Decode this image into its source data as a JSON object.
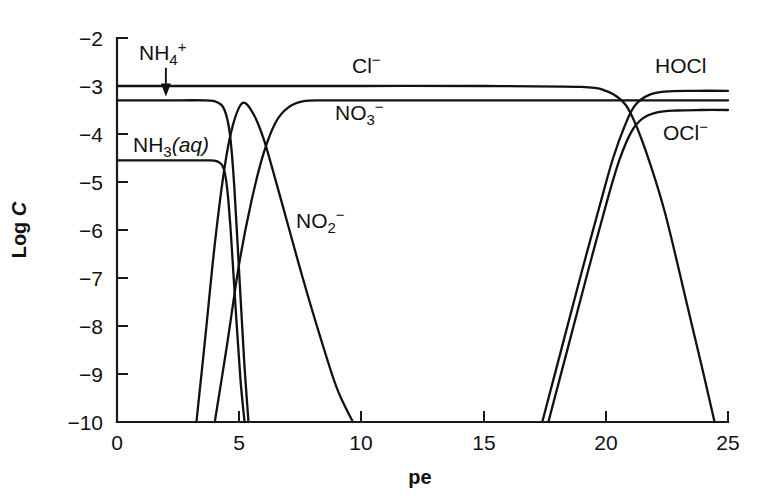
{
  "chart_data": {
    "type": "line",
    "title": "",
    "xlabel": "pe",
    "ylabel": "Log C",
    "xlim": [
      0,
      25
    ],
    "ylim": [
      -10,
      -2
    ],
    "xticks": [
      0,
      5,
      10,
      15,
      20,
      25
    ],
    "yticks": [
      -2,
      -3,
      -4,
      -5,
      -6,
      -7,
      -8,
      -9,
      -10
    ],
    "xtick_labels": [
      "0",
      "5",
      "10",
      "15",
      "20",
      "25"
    ],
    "ytick_labels": [
      "−2",
      "−3",
      "−4",
      "−5",
      "−6",
      "−7",
      "−8",
      "−9",
      "−10"
    ],
    "grid": false,
    "legend": "inline-annotations",
    "line_color": "#111111",
    "axis_color": "#1a1a1a",
    "background": "#ffffff",
    "series": [
      {
        "name": "Cl-",
        "label_text": "Cl",
        "label_sup": "−",
        "label_sub": "",
        "plateau": -3.0,
        "x": [
          0,
          5,
          10,
          15,
          19.0,
          20.0,
          20.6,
          21.0,
          21.6,
          22.4,
          23.3,
          24.0,
          24.45
        ],
        "y": [
          -3.0,
          -3.0,
          -3.0,
          -3.0,
          -3.02,
          -3.1,
          -3.28,
          -3.55,
          -4.3,
          -5.6,
          -7.5,
          -9.0,
          -10.0
        ]
      },
      {
        "name": "NH4+",
        "label_text": "NH",
        "label_sub": "4",
        "label_sup": "+",
        "plateau": -3.3,
        "x": [
          0,
          2,
          3.6,
          4.1,
          4.4,
          4.62,
          4.8,
          5.0,
          5.2,
          5.38
        ],
        "y": [
          -3.3,
          -3.3,
          -3.3,
          -3.34,
          -3.5,
          -4.0,
          -5.1,
          -6.9,
          -8.7,
          -10.0
        ]
      },
      {
        "name": "NH3(aq)",
        "label_text": "NH",
        "label_sub": "3",
        "label_suffix": "(aq)",
        "plateau": -4.55,
        "x": [
          0,
          2,
          3.6,
          4.1,
          4.35,
          4.5,
          4.65,
          4.85,
          5.05,
          5.22
        ],
        "y": [
          -4.55,
          -4.55,
          -4.55,
          -4.57,
          -4.7,
          -5.1,
          -6.0,
          -7.6,
          -9.1,
          -10.0
        ]
      },
      {
        "name": "NO2-",
        "label_text": "NO",
        "label_sub": "2",
        "label_sup": "−",
        "peak": -3.35,
        "peak_pe": 5.15,
        "x": [
          3.25,
          3.6,
          4.0,
          4.4,
          4.75,
          5.15,
          5.6,
          6.0,
          6.4,
          7.0,
          7.6,
          8.3,
          9.0,
          9.65
        ],
        "y": [
          -10.0,
          -8.3,
          -6.3,
          -4.7,
          -3.8,
          -3.35,
          -3.6,
          -4.1,
          -4.8,
          -5.9,
          -7.0,
          -8.2,
          -9.3,
          -10.0
        ]
      },
      {
        "name": "NO3-",
        "label_text": "NO",
        "label_sub": "3",
        "label_sup": "−",
        "plateau": -3.3,
        "x": [
          4.0,
          4.5,
          5.0,
          5.5,
          6.0,
          6.5,
          7.0,
          7.6,
          8.5,
          10,
          13,
          17,
          21,
          25
        ],
        "y": [
          -10.0,
          -8.4,
          -6.7,
          -5.4,
          -4.4,
          -3.75,
          -3.45,
          -3.32,
          -3.3,
          -3.3,
          -3.3,
          -3.3,
          -3.3,
          -3.3
        ]
      },
      {
        "name": "HOCl",
        "label_text": "HOCl",
        "label_sup": "",
        "plateau": -3.1,
        "x": [
          17.4,
          18.2,
          19.0,
          19.8,
          20.3,
          20.8,
          21.2,
          21.8,
          22.6,
          23.6,
          25
        ],
        "y": [
          -10.0,
          -8.45,
          -6.9,
          -5.4,
          -4.5,
          -3.8,
          -3.4,
          -3.18,
          -3.11,
          -3.1,
          -3.1
        ]
      },
      {
        "name": "OCl-",
        "label_text": "OCl",
        "label_sup": "−",
        "plateau": -3.5,
        "x": [
          17.65,
          18.45,
          19.25,
          20.05,
          20.55,
          21.05,
          21.5,
          22.1,
          22.9,
          23.9,
          25
        ],
        "y": [
          -10.0,
          -8.45,
          -6.9,
          -5.4,
          -4.55,
          -3.95,
          -3.68,
          -3.55,
          -3.51,
          -3.5,
          -3.5
        ]
      }
    ],
    "annotations": [
      {
        "name": "nh4-arrow",
        "from_pe": 2.0,
        "from_logc": -2.62,
        "to_pe": 2.0,
        "to_logc": -3.22
      }
    ]
  }
}
